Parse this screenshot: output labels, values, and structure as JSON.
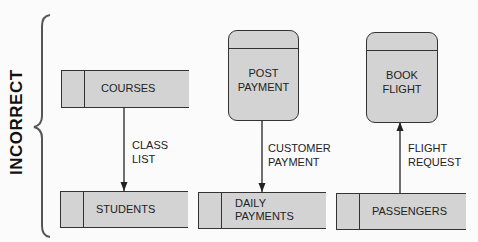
{
  "title": "INCORRECT",
  "colors": {
    "fill": "#d3d3d3",
    "stroke": "#333333",
    "background": "#fbfbfb"
  },
  "data_stores": [
    {
      "id": "courses",
      "label": "COURSES"
    },
    {
      "id": "students",
      "label": "STUDENTS"
    },
    {
      "id": "daily_payments",
      "label_line1": "DAILY",
      "label_line2": "PAYMENTS"
    },
    {
      "id": "passengers",
      "label": "PASSENGERS"
    }
  ],
  "processes": [
    {
      "id": "post_payment",
      "label_line1": "POST",
      "label_line2": "PAYMENT"
    },
    {
      "id": "book_flight",
      "label_line1": "BOOK",
      "label_line2": "FLIGHT"
    }
  ],
  "flows": [
    {
      "from": "COURSES",
      "to": "STUDENTS",
      "label_line1": "CLASS",
      "label_line2": "LIST"
    },
    {
      "from": "POST PAYMENT",
      "to": "DAILY PAYMENTS",
      "label_line1": "CUSTOMER",
      "label_line2": "PAYMENT"
    },
    {
      "from": "PASSENGERS",
      "to": "BOOK FLIGHT",
      "label_line1": "FLIGHT",
      "label_line2": "REQUEST"
    }
  ]
}
